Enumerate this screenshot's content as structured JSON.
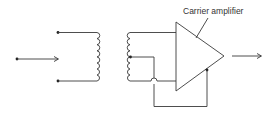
{
  "diagram": {
    "labels": {
      "amplifier": "Carrier amplifier"
    },
    "components": [
      {
        "id": "input-terminal",
        "type": "terminal"
      },
      {
        "id": "input-arrow",
        "type": "signal-arrow"
      },
      {
        "id": "primary-winding",
        "type": "coil",
        "turns": 4
      },
      {
        "id": "secondary-winding",
        "type": "coil",
        "turns": 4,
        "center_tap": true
      },
      {
        "id": "carrier-amplifier",
        "type": "triangle-amplifier"
      },
      {
        "id": "feedback-loop",
        "type": "wire"
      },
      {
        "id": "output-arrow",
        "type": "signal-arrow"
      }
    ],
    "colors": {
      "stroke": "#3a3a3a",
      "text": "#333333",
      "background": "#ffffff"
    }
  }
}
